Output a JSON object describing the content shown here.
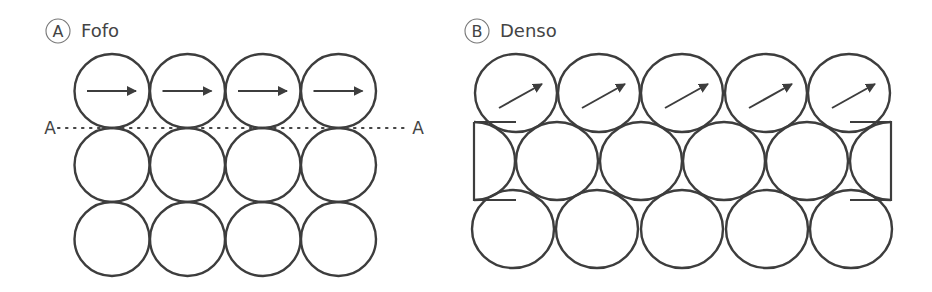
{
  "panels": [
    {
      "id": "A",
      "badge": "A",
      "title": "Fofo",
      "arrangement": "square packing",
      "columns": 4,
      "rows": 3,
      "top_row_arrow_direction": "horizontal",
      "section_line": {
        "left_label": "A",
        "right_label": "A",
        "style": "dotted"
      }
    },
    {
      "id": "B",
      "badge": "B",
      "title": "Denso",
      "arrangement": "offset (staggered) packing",
      "columns": 5,
      "rows": 3,
      "top_row_arrow_direction": "diagonal-up-right",
      "middle_row_framed": true
    }
  ],
  "colors": {
    "stroke": "#3d3d3d",
    "text": "#444444",
    "background": "#ffffff"
  }
}
